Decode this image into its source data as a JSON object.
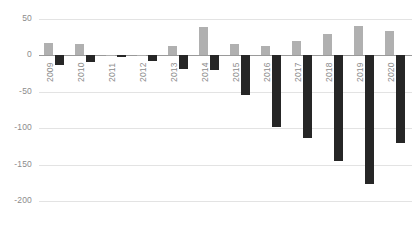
{
  "chart_data": {
    "type": "bar",
    "title": "",
    "subtitle": "",
    "xlabel": "",
    "ylabel": "",
    "categories": [
      "2009",
      "2010",
      "2011",
      "2012",
      "2013",
      "2014",
      "2015",
      "2016",
      "2017",
      "2018",
      "2019",
      "2020"
    ],
    "series": [
      {
        "name": "positive",
        "color": "#b0b0b0",
        "values": [
          17,
          16,
          1,
          0,
          13,
          39,
          16,
          13,
          20,
          29,
          41,
          34
        ]
      },
      {
        "name": "negative",
        "color": "#262626",
        "values": [
          -13,
          -9,
          -2,
          -8,
          -18,
          -20,
          -55,
          -98,
          -113,
          -145,
          -176,
          -120
        ]
      }
    ],
    "ylim": [
      -200,
      50
    ],
    "yticks": [
      50,
      0,
      -50,
      -100,
      -150,
      -200
    ],
    "ytick_labels": [
      "50",
      "0",
      "-50",
      "-100",
      "-150",
      "-200"
    ],
    "grid": true,
    "grid_axis": "y",
    "legend": "none",
    "zero_line": 0
  },
  "axis": {
    "y_label_color": "#8c8c8c",
    "x_label_color": "#8c8c8c",
    "grid_color": "#e3e3e3",
    "zero_line_color": "#9a9a9a"
  }
}
